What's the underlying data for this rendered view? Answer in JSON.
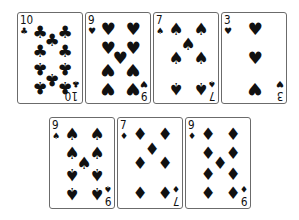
{
  "game": "playing-cards",
  "rows": [
    {
      "cards": [
        {
          "rank": "10",
          "suit": "clubs",
          "glyph": "♣",
          "color": "#111111"
        },
        {
          "rank": "9",
          "suit": "hearts",
          "glyph": "♥",
          "color": "#111111"
        },
        {
          "rank": "7",
          "suit": "spades",
          "glyph": "♠",
          "color": "#111111"
        },
        {
          "rank": "3",
          "suit": "hearts",
          "glyph": "♥",
          "color": "#111111"
        }
      ]
    },
    {
      "cards": [
        {
          "rank": "9",
          "suit": "spades",
          "glyph": "♠",
          "color": "#111111"
        },
        {
          "rank": "7",
          "suit": "diamonds",
          "glyph": "♦",
          "color": "#111111"
        },
        {
          "rank": "9",
          "suit": "diamonds",
          "glyph": "♦",
          "color": "#111111"
        }
      ]
    }
  ]
}
